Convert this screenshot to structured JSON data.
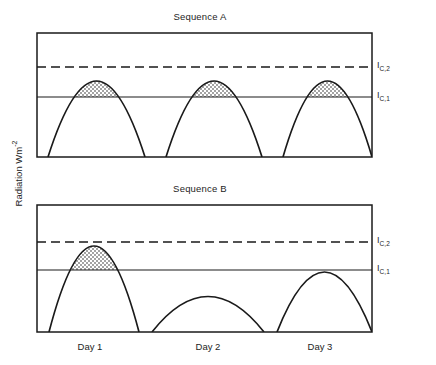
{
  "figure": {
    "y_axis_label_text": "Radiation Wm",
    "y_axis_label_exponent": "-2",
    "ink_color": "#1a1a1a",
    "background_color": "#ffffff",
    "stipple_color": "#1a1a1a"
  },
  "panels": [
    {
      "id": "A",
      "title": "Sequence A",
      "thresholds": [
        {
          "name": "I_C,2",
          "label_base": "I",
          "label_sub": "C,2",
          "style": "dashed",
          "y": 67
        },
        {
          "name": "I_C,1",
          "label_base": "I",
          "label_sub": "C,1",
          "style": "solid",
          "y": 97
        }
      ]
    },
    {
      "id": "B",
      "title": "Sequence B",
      "thresholds": [
        {
          "name": "I_C,2",
          "label_base": "I",
          "label_sub": "C,2",
          "style": "dashed",
          "y": 242
        },
        {
          "name": "I_C,1",
          "label_base": "I",
          "label_sub": "C,1",
          "style": "solid",
          "y": 270
        }
      ]
    }
  ],
  "x_axis": {
    "ticks": [
      "Day 1",
      "Day 2",
      "Day 3"
    ],
    "tick_centers": [
      90,
      208,
      320
    ]
  },
  "chart_data": {
    "type": "line",
    "xlabel": "",
    "ylabel": "Radiation Wm-2",
    "grid": false,
    "legend": "none",
    "x_tick_labels": [
      "Day 1",
      "Day 2",
      "Day 3"
    ],
    "threshold_levels": {
      "I_C,1": {
        "value": 0.45,
        "style": "solid",
        "note": "lower critical radiation threshold"
      },
      "I_C,2": {
        "value": 0.72,
        "style": "dashed",
        "note": "upper critical radiation threshold"
      }
    },
    "ylim": [
      0,
      1
    ],
    "panels": [
      {
        "name": "Sequence A",
        "note": "Three identical days; each daily peak just reaches I_C,2, so every day contributes an equal shaded dose above I_C,1.",
        "days": [
          {
            "label": "Day 1",
            "peak": 0.72,
            "sunrise_x": 0.032,
            "sunset_x": 0.322,
            "shaded_above": "I_C,1",
            "shaded": true
          },
          {
            "label": "Day 2",
            "peak": 0.72,
            "sunrise_x": 0.385,
            "sunset_x": 0.672,
            "shaded_above": "I_C,1",
            "shaded": true
          },
          {
            "label": "Day 3",
            "peak": 0.72,
            "sunrise_x": 0.735,
            "sunset_x": 1.0,
            "shaded_above": "I_C,1",
            "shaded": true
          }
        ]
      },
      {
        "name": "Sequence B",
        "note": "Variable days; Day 1 peaks far above I_C,2, Day 2 stays below I_C,1 with no shading, Day 3 peaks exactly at I_C,2.",
        "days": [
          {
            "label": "Day 1",
            "peak": 1.0,
            "sunrise_x": 0.035,
            "sunset_x": 0.295,
            "shaded_above": "I_C,1",
            "shaded": true
          },
          {
            "label": "Day 2",
            "peak": 0.35,
            "sunrise_x": 0.345,
            "sunset_x": 0.655,
            "shaded_above": "I_C,1",
            "shaded": false
          },
          {
            "label": "Day 3",
            "peak": 0.72,
            "sunrise_x": 0.715,
            "sunset_x": 1.0,
            "shaded_above": "I_C,1",
            "shaded": true
          }
        ]
      }
    ]
  }
}
